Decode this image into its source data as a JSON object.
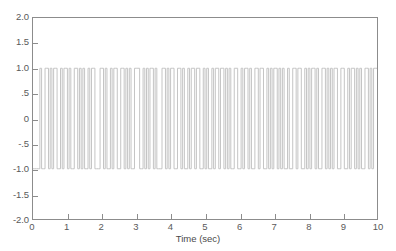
{
  "chart_data": {
    "type": "line",
    "title": "",
    "subtitle": "",
    "xlabel": "Time (sec)",
    "ylabel": "",
    "xlim": [
      0,
      10
    ],
    "ylim": [
      -2.0,
      2.0
    ],
    "grid": false,
    "legend": null,
    "legend_position": "none",
    "line_color": "#c4c4c4",
    "axis_color": "#8c8c8c",
    "text_color": "#5a5a5a",
    "signal_levels": [
      1.0,
      -1.0
    ],
    "bit_duration_sec": 0.05,
    "num_bits": 200,
    "xticks": [
      0,
      1,
      2,
      3,
      4,
      5,
      6,
      7,
      8,
      9,
      10
    ],
    "xtick_labels": [
      "0",
      "1",
      "2",
      "3",
      "4",
      "5",
      "6",
      "7",
      "8",
      "9",
      "10"
    ],
    "yticks": [
      2.0,
      1.5,
      1.0,
      0.5,
      0,
      -0.5,
      -1.0,
      -1.5,
      -2.0
    ],
    "ytick_labels": [
      "2.0",
      "1.5",
      "1.0",
      ".5",
      "0",
      "-.5",
      "-1.0",
      "-1.5",
      "-2.0"
    ],
    "bits": [
      -1,
      -1,
      -1,
      -1,
      1,
      -1,
      -1,
      1,
      1,
      -1,
      1,
      -1,
      1,
      1,
      -1,
      -1,
      1,
      -1,
      1,
      1,
      -1,
      1,
      -1,
      -1,
      1,
      1,
      -1,
      1,
      -1,
      1,
      -1,
      -1,
      1,
      -1,
      1,
      1,
      -1,
      -1,
      -1,
      1,
      1,
      -1,
      1,
      -1,
      -1,
      1,
      -1,
      1,
      1,
      -1,
      -1,
      1,
      1,
      -1,
      1,
      -1,
      1,
      -1,
      -1,
      1,
      1,
      1,
      -1,
      -1,
      1,
      -1,
      1,
      -1,
      1,
      1,
      -1,
      1,
      -1,
      -1,
      -1,
      1,
      1,
      -1,
      1,
      -1,
      1,
      1,
      -1,
      -1,
      1,
      1,
      -1,
      1,
      -1,
      -1,
      1,
      -1,
      1,
      1,
      -1,
      1,
      1,
      -1,
      -1,
      1,
      -1,
      1,
      -1,
      -1,
      1,
      -1,
      1,
      1,
      -1,
      1,
      1,
      -1,
      1,
      -1,
      1,
      -1,
      -1,
      1,
      1,
      -1,
      -1,
      1,
      -1,
      1,
      1,
      -1,
      1,
      -1,
      -1,
      1,
      1,
      -1,
      1,
      1,
      -1,
      -1,
      1,
      -1,
      1,
      -1,
      1,
      1,
      -1,
      1,
      -1,
      1,
      -1,
      -1,
      1,
      -1,
      -1,
      1,
      1,
      -1,
      1,
      1,
      -1,
      -1,
      1,
      -1,
      1,
      -1,
      1,
      1,
      -1,
      1,
      -1,
      -1,
      1,
      1,
      -1,
      1,
      -1,
      1,
      -1,
      1,
      1,
      -1,
      -1,
      1,
      1,
      -1,
      -1,
      1,
      -1,
      1,
      1,
      -1,
      1,
      -1,
      1,
      -1,
      -1,
      1,
      1,
      -1,
      1,
      -1,
      1,
      1
    ]
  },
  "axis": {
    "xlabel": "Time (sec)"
  }
}
